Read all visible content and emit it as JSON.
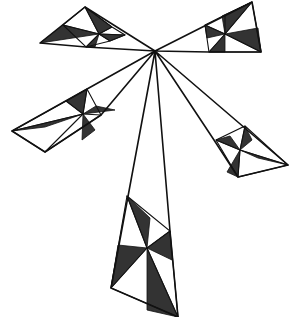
{
  "figure": {
    "title": "",
    "colors": {
      "fill": "#333333",
      "stroke": "#111111",
      "background": "#ffffff"
    },
    "hub": [
      155,
      51
    ],
    "blades": [
      {
        "name": "top-left",
        "outline": [
          [
            155,
            51
          ],
          [
            85,
            7
          ],
          [
            40,
            43
          ],
          [
            86,
            47
          ]
        ],
        "center": [
          99,
          34
        ],
        "inner_quad": [
          [
            85,
            7
          ],
          [
            112,
            27
          ],
          [
            125,
            35
          ],
          [
            110,
            41
          ],
          [
            86,
            47
          ],
          [
            63,
            25
          ]
        ],
        "shaded": [
          [
            [
              85,
              7
            ],
            [
              112,
              27
            ],
            [
              99,
              34
            ]
          ],
          [
            [
              125,
              35
            ],
            [
              110,
              41
            ],
            [
              99,
              34
            ]
          ],
          [
            [
              40,
              43
            ],
            [
              63,
              25
            ],
            [
              99,
              34
            ]
          ],
          [
            [
              86,
              47
            ],
            [
              95,
              47
            ],
            [
              99,
              34
            ]
          ]
        ]
      },
      {
        "name": "top-right",
        "outline": [
          [
            155,
            51
          ],
          [
            252,
            2
          ],
          [
            261,
            52
          ],
          [
            209,
            52
          ]
        ],
        "center": [
          225,
          34
        ],
        "inner_quad": [
          [
            205,
            25
          ],
          [
            225,
            15
          ],
          [
            252,
            2
          ],
          [
            261,
            52
          ],
          [
            209,
            52
          ]
        ],
        "shaded": [
          [
            [
              222,
              16
            ],
            [
              252,
              2
            ],
            [
              225,
              34
            ]
          ],
          [
            [
              258,
              28
            ],
            [
              261,
              52
            ],
            [
              225,
              34
            ]
          ],
          [
            [
              205,
              25
            ],
            [
              207,
              38
            ],
            [
              225,
              34
            ]
          ],
          [
            [
              209,
              52
            ],
            [
              225,
              52
            ],
            [
              225,
              34
            ]
          ]
        ]
      },
      {
        "name": "left",
        "outline": [
          [
            155,
            51
          ],
          [
            12,
            131
          ],
          [
            45,
            152
          ],
          [
            101,
            115
          ]
        ],
        "center": [
          83,
          114
        ],
        "inner_quad": [
          [
            66,
            101
          ],
          [
            87,
            89
          ],
          [
            101,
            115
          ],
          [
            45,
            152
          ],
          [
            12,
            131
          ]
        ],
        "shaded": [
          [
            [
              66,
              101
            ],
            [
              87,
              89
            ],
            [
              83,
              114
            ]
          ],
          [
            [
              96,
              106
            ],
            [
              115,
              110
            ],
            [
              83,
              114
            ]
          ],
          [
            [
              12,
              131
            ],
            [
              45,
              127
            ],
            [
              83,
              114
            ]
          ],
          [
            [
              82,
              140
            ],
            [
              95,
              130
            ],
            [
              83,
              114
            ]
          ]
        ]
      },
      {
        "name": "right",
        "outline": [
          [
            155,
            51
          ],
          [
            214,
            140
          ],
          [
            238,
            177
          ],
          [
            288,
            165
          ]
        ],
        "center": [
          240,
          150
        ],
        "inner_quad": [
          [
            216,
            140
          ],
          [
            245,
            126
          ],
          [
            288,
            165
          ],
          [
            238,
            177
          ]
        ],
        "shaded": [
          [
            [
              216,
              140
            ],
            [
              230,
              136
            ],
            [
              240,
              150
            ]
          ],
          [
            [
              245,
              126
            ],
            [
              252,
              140
            ],
            [
              240,
              150
            ]
          ],
          [
            [
              288,
              165
            ],
            [
              258,
              158
            ],
            [
              240,
              150
            ]
          ],
          [
            [
              227,
              172
            ],
            [
              238,
              177
            ],
            [
              240,
              150
            ]
          ]
        ]
      },
      {
        "name": "bottom",
        "outline": [
          [
            155,
            51
          ],
          [
            111,
            288
          ],
          [
            178,
            317
          ],
          [
            170,
            231
          ]
        ],
        "center": [
          147,
          248
        ],
        "inner_quad": [
          [
            127,
            196
          ],
          [
            170,
            231
          ],
          [
            178,
            317
          ],
          [
            111,
            288
          ]
        ],
        "shaded": [
          [
            [
              127,
              196
            ],
            [
              150,
              218
            ],
            [
              147,
              248
            ]
          ],
          [
            [
              170,
              231
            ],
            [
              172,
              260
            ],
            [
              147,
              248
            ]
          ],
          [
            [
              111,
              288
            ],
            [
              118,
              245
            ],
            [
              147,
              248
            ]
          ],
          [
            [
              147,
              310
            ],
            [
              178,
              317
            ],
            [
              147,
              248
            ]
          ]
        ]
      }
    ]
  }
}
